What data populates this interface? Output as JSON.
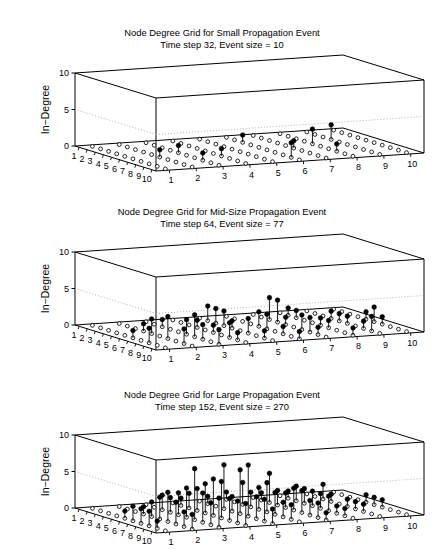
{
  "figure": {
    "width": 444,
    "height": 536,
    "background": "#ffffff",
    "cut_off_top_text": "",
    "line_color": "#000000",
    "grid_color": "#aaaaaa"
  },
  "axes": {
    "zlabel": "In-Degree",
    "z_ticks": [
      0,
      5,
      10
    ],
    "z_min": 0,
    "z_max": 10,
    "x_ticks": [
      1,
      2,
      3,
      4,
      5,
      6,
      7,
      8,
      9,
      10
    ],
    "y_ticks": [
      1,
      2,
      3,
      4,
      5,
      6,
      7,
      8,
      9,
      10
    ],
    "grid_n": 10,
    "gridline_at_z": 5,
    "marker_filled": "filled-circle",
    "marker_open": "open-circle"
  },
  "panels": [
    {
      "id": "small-propagation-event",
      "title_line1": "Node Degree Grid for Small Propagation Event",
      "title_line2": "Time step 32, Event size = 10",
      "time_step": 32,
      "event_size": 10,
      "title_top": 27,
      "plot_top": 58,
      "plot_height": 120,
      "chart_ref": 0
    },
    {
      "id": "mid-size-propagation-event",
      "title_line1": "Node Degree Grid for Mid-Size Propagation Event",
      "title_line2": "Time step 64, Event size = 77",
      "time_step": 64,
      "event_size": 77,
      "title_top": 206,
      "plot_top": 237,
      "plot_height": 120,
      "chart_ref": 1
    },
    {
      "id": "large-propagation-event",
      "title_line1": "Node Degree Grid for Large Propagation Event",
      "title_line2": "Time step 152, Event size = 270",
      "time_step": 152,
      "event_size": 270,
      "title_top": 389,
      "plot_top": 420,
      "plot_height": 120,
      "chart_ref": 2
    }
  ],
  "chart_data": [
    {
      "type": "scatter",
      "subtype": "stem3",
      "title": "Node Degree Grid for Small Propagation Event",
      "subtitle": "Time step 32, Event size = 10",
      "xlabel": "",
      "ylabel": "",
      "zlabel": "In-Degree",
      "xlim": [
        1,
        10
      ],
      "ylim": [
        1,
        10
      ],
      "zlim": [
        0,
        10
      ],
      "x": [
        1,
        2,
        3,
        4,
        5,
        6,
        7,
        8,
        9,
        10
      ],
      "y": [
        1,
        2,
        3,
        4,
        5,
        6,
        7,
        8,
        9,
        10
      ],
      "grid": "10x10 lattice of nodes; open circles mark zero-degree nodes on the base plane, filled circles on vertical stems mark nodes with nonzero in-degree",
      "stems": [
        {
          "x": 3,
          "y": 6,
          "z": 1
        },
        {
          "x": 5,
          "y": 8,
          "z": 2
        },
        {
          "x": 4,
          "y": 9,
          "z": 2
        },
        {
          "x": 6,
          "y": 7,
          "z": 1
        },
        {
          "x": 7,
          "y": 4,
          "z": 1
        },
        {
          "x": 8,
          "y": 3,
          "z": 1
        },
        {
          "x": 6,
          "y": 2,
          "z": 1
        },
        {
          "x": 9,
          "y": 6,
          "z": 2
        },
        {
          "x": 8,
          "y": 8,
          "z": 1
        },
        {
          "x": 5,
          "y": 3,
          "z": 1
        }
      ],
      "grid_on": true,
      "legend": null
    },
    {
      "type": "scatter",
      "subtype": "stem3",
      "title": "Node Degree Grid for Mid-Size Propagation Event",
      "subtitle": "Time step 64, Event size = 77",
      "xlabel": "",
      "ylabel": "",
      "zlabel": "In-Degree",
      "xlim": [
        1,
        10
      ],
      "ylim": [
        1,
        10
      ],
      "zlim": [
        0,
        10
      ],
      "x": [
        1,
        2,
        3,
        4,
        5,
        6,
        7,
        8,
        9,
        10
      ],
      "y": [
        1,
        2,
        3,
        4,
        5,
        6,
        7,
        8,
        9,
        10
      ],
      "grid": "10x10 lattice of nodes; open circles mark zero-degree nodes on the base plane, filled circles on vertical stems mark nodes with nonzero in-degree",
      "stems": [
        {
          "x": 2,
          "y": 5,
          "z": 2
        },
        {
          "x": 3,
          "y": 5,
          "z": 2
        },
        {
          "x": 3,
          "y": 7,
          "z": 3
        },
        {
          "x": 4,
          "y": 7,
          "z": 3
        },
        {
          "x": 3,
          "y": 8,
          "z": 1
        },
        {
          "x": 4,
          "y": 4,
          "z": 1
        },
        {
          "x": 4,
          "y": 9,
          "z": 1
        },
        {
          "x": 5,
          "y": 2,
          "z": 2
        },
        {
          "x": 5,
          "y": 5,
          "z": 1
        },
        {
          "x": 5,
          "y": 6,
          "z": 2
        },
        {
          "x": 5,
          "y": 9,
          "z": 1
        },
        {
          "x": 5,
          "y": 10,
          "z": 1
        },
        {
          "x": 6,
          "y": 1,
          "z": 1
        },
        {
          "x": 6,
          "y": 3,
          "z": 2
        },
        {
          "x": 6,
          "y": 4,
          "z": 1
        },
        {
          "x": 6,
          "y": 6,
          "z": 2
        },
        {
          "x": 6,
          "y": 8,
          "z": 1
        },
        {
          "x": 6,
          "y": 9,
          "z": 1
        },
        {
          "x": 7,
          "y": 2,
          "z": 3
        },
        {
          "x": 7,
          "y": 3,
          "z": 3
        },
        {
          "x": 7,
          "y": 5,
          "z": 2
        },
        {
          "x": 7,
          "y": 7,
          "z": 2
        },
        {
          "x": 7,
          "y": 8,
          "z": 1
        },
        {
          "x": 7,
          "y": 10,
          "z": 1
        },
        {
          "x": 8,
          "y": 1,
          "z": 2
        },
        {
          "x": 8,
          "y": 3,
          "z": 2
        },
        {
          "x": 8,
          "y": 4,
          "z": 2
        },
        {
          "x": 8,
          "y": 6,
          "z": 1
        },
        {
          "x": 8,
          "y": 9,
          "z": 1
        },
        {
          "x": 9,
          "y": 2,
          "z": 2
        },
        {
          "x": 9,
          "y": 4,
          "z": 1
        },
        {
          "x": 9,
          "y": 5,
          "z": 1
        },
        {
          "x": 9,
          "y": 7,
          "z": 1
        },
        {
          "x": 10,
          "y": 3,
          "z": 2
        },
        {
          "x": 10,
          "y": 6,
          "z": 1
        },
        {
          "x": 2,
          "y": 8,
          "z": 1
        },
        {
          "x": 4,
          "y": 2,
          "z": 1
        },
        {
          "x": 9,
          "y": 9,
          "z": 2
        },
        {
          "x": 10,
          "y": 8,
          "z": 1
        },
        {
          "x": 6,
          "y": 10,
          "z": 2
        },
        {
          "x": 3,
          "y": 3,
          "z": 1
        },
        {
          "x": 4,
          "y": 5,
          "z": 2
        },
        {
          "x": 8,
          "y": 7,
          "z": 2
        },
        {
          "x": 5,
          "y": 7,
          "z": 1
        }
      ],
      "grid_on": true,
      "legend": null
    },
    {
      "type": "scatter",
      "subtype": "stem3",
      "title": "Node Degree Grid for Large Propagation Event",
      "subtitle": "Time step 152, Event size = 270",
      "xlabel": "",
      "ylabel": "",
      "zlabel": "In-Degree",
      "xlim": [
        1,
        10
      ],
      "ylim": [
        1,
        10
      ],
      "zlim": [
        0,
        10
      ],
      "x": [
        1,
        2,
        3,
        4,
        5,
        6,
        7,
        8,
        9,
        10
      ],
      "y": [
        1,
        2,
        3,
        4,
        5,
        6,
        7,
        8,
        9,
        10
      ],
      "grid": "10x10 lattice of nodes; open circles mark zero-degree nodes on the base plane, filled circles on vertical stems mark nodes with nonzero in-degree",
      "stems": [
        {
          "x": 1,
          "y": 6,
          "z": 1
        },
        {
          "x": 2,
          "y": 8,
          "z": 1
        },
        {
          "x": 3,
          "y": 4,
          "z": 2
        },
        {
          "x": 3,
          "y": 6,
          "z": 3
        },
        {
          "x": 3,
          "y": 7,
          "z": 4
        },
        {
          "x": 3,
          "y": 8,
          "z": 2
        },
        {
          "x": 3,
          "y": 9,
          "z": 2
        },
        {
          "x": 4,
          "y": 2,
          "z": 1
        },
        {
          "x": 4,
          "y": 4,
          "z": 3
        },
        {
          "x": 4,
          "y": 5,
          "z": 6
        },
        {
          "x": 4,
          "y": 6,
          "z": 2
        },
        {
          "x": 4,
          "y": 7,
          "z": 2
        },
        {
          "x": 4,
          "y": 9,
          "z": 1
        },
        {
          "x": 5,
          "y": 1,
          "z": 1
        },
        {
          "x": 5,
          "y": 3,
          "z": 3
        },
        {
          "x": 5,
          "y": 4,
          "z": 4
        },
        {
          "x": 5,
          "y": 5,
          "z": 2
        },
        {
          "x": 5,
          "y": 6,
          "z": 3
        },
        {
          "x": 5,
          "y": 7,
          "z": 2
        },
        {
          "x": 5,
          "y": 8,
          "z": 2
        },
        {
          "x": 5,
          "y": 10,
          "z": 1
        },
        {
          "x": 6,
          "y": 1,
          "z": 2
        },
        {
          "x": 6,
          "y": 2,
          "z": 3
        },
        {
          "x": 6,
          "y": 3,
          "z": 4
        },
        {
          "x": 6,
          "y": 4,
          "z": 5
        },
        {
          "x": 6,
          "y": 5,
          "z": 6
        },
        {
          "x": 6,
          "y": 6,
          "z": 4
        },
        {
          "x": 6,
          "y": 7,
          "z": 3
        },
        {
          "x": 6,
          "y": 8,
          "z": 2
        },
        {
          "x": 6,
          "y": 9,
          "z": 1
        },
        {
          "x": 7,
          "y": 1,
          "z": 2
        },
        {
          "x": 7,
          "y": 2,
          "z": 4
        },
        {
          "x": 7,
          "y": 3,
          "z": 7
        },
        {
          "x": 7,
          "y": 4,
          "z": 5
        },
        {
          "x": 7,
          "y": 5,
          "z": 7
        },
        {
          "x": 7,
          "y": 6,
          "z": 3
        },
        {
          "x": 7,
          "y": 7,
          "z": 3
        },
        {
          "x": 7,
          "y": 8,
          "z": 2
        },
        {
          "x": 7,
          "y": 9,
          "z": 1
        },
        {
          "x": 8,
          "y": 1,
          "z": 2
        },
        {
          "x": 8,
          "y": 2,
          "z": 3
        },
        {
          "x": 8,
          "y": 3,
          "z": 4
        },
        {
          "x": 8,
          "y": 4,
          "z": 3
        },
        {
          "x": 8,
          "y": 5,
          "z": 3
        },
        {
          "x": 8,
          "y": 6,
          "z": 2
        },
        {
          "x": 8,
          "y": 7,
          "z": 2
        },
        {
          "x": 8,
          "y": 8,
          "z": 1
        },
        {
          "x": 9,
          "y": 2,
          "z": 2
        },
        {
          "x": 9,
          "y": 3,
          "z": 3
        },
        {
          "x": 9,
          "y": 4,
          "z": 3
        },
        {
          "x": 9,
          "y": 5,
          "z": 3
        },
        {
          "x": 9,
          "y": 6,
          "z": 2
        },
        {
          "x": 9,
          "y": 8,
          "z": 1
        },
        {
          "x": 10,
          "y": 3,
          "z": 4
        },
        {
          "x": 10,
          "y": 5,
          "z": 2
        },
        {
          "x": 10,
          "y": 7,
          "z": 1
        },
        {
          "x": 2,
          "y": 5,
          "z": 1
        },
        {
          "x": 2,
          "y": 7,
          "z": 1
        },
        {
          "x": 4,
          "y": 3,
          "z": 2
        },
        {
          "x": 5,
          "y": 2,
          "z": 2
        },
        {
          "x": 6,
          "y": 10,
          "z": 1
        },
        {
          "x": 9,
          "y": 7,
          "z": 2
        },
        {
          "x": 10,
          "y": 2,
          "z": 2
        },
        {
          "x": 8,
          "y": 9,
          "z": 1
        },
        {
          "x": 2,
          "y": 4,
          "z": 1
        },
        {
          "x": 3,
          "y": 3,
          "z": 2
        },
        {
          "x": 4,
          "y": 8,
          "z": 2
        },
        {
          "x": 7,
          "y": 10,
          "z": 1
        },
        {
          "x": 10,
          "y": 4,
          "z": 3
        },
        {
          "x": 9,
          "y": 1,
          "z": 1
        }
      ],
      "grid_on": true,
      "legend": null
    }
  ]
}
